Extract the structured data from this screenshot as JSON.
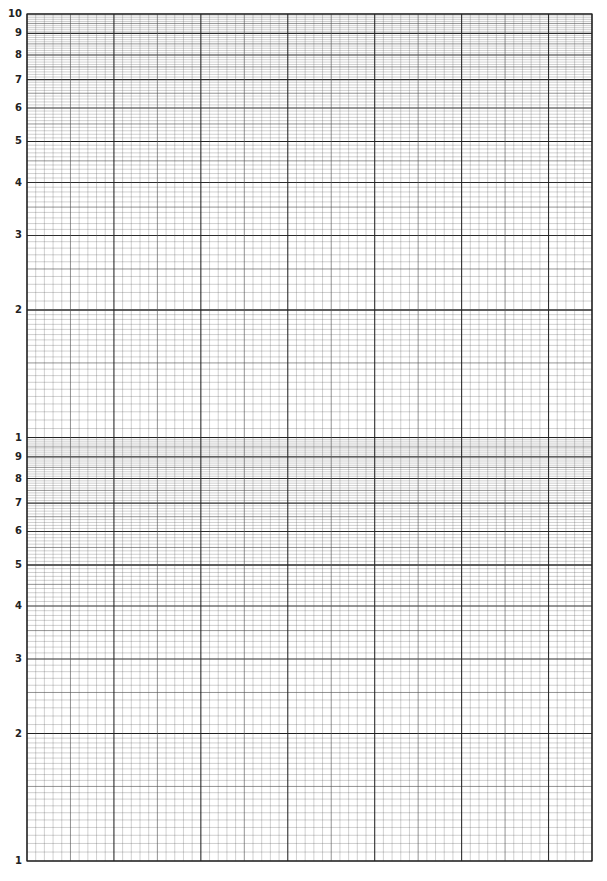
{
  "page": {
    "type": "semi-log graph paper"
  },
  "grid": {
    "left": 27,
    "right": 592,
    "top": 14,
    "bottom": 861,
    "cycles": 2,
    "vertical_divisions": 65,
    "vertical_major_every": 10,
    "vertical_medium_every": 5,
    "line_color": "#555555",
    "major_color": "#222222",
    "background": "#ffffff"
  },
  "y_axis": {
    "scale": "log",
    "decade_labels_top": [
      "10",
      "9",
      "8",
      "7",
      "6",
      "5",
      "4",
      "3",
      "2"
    ],
    "decade_labels_bottom": [
      "1",
      "9",
      "8",
      "7",
      "6",
      "5",
      "4",
      "3",
      "2",
      "1"
    ],
    "labels": [
      {
        "text": "10",
        "value": 10,
        "cycle": 1
      },
      {
        "text": "9",
        "value": 9,
        "cycle": 1
      },
      {
        "text": "8",
        "value": 8,
        "cycle": 1
      },
      {
        "text": "7",
        "value": 7,
        "cycle": 1
      },
      {
        "text": "6",
        "value": 6,
        "cycle": 1
      },
      {
        "text": "5",
        "value": 5,
        "cycle": 1
      },
      {
        "text": "4",
        "value": 4,
        "cycle": 1
      },
      {
        "text": "3",
        "value": 3,
        "cycle": 1
      },
      {
        "text": "2",
        "value": 2,
        "cycle": 1
      },
      {
        "text": "1",
        "value": 1,
        "cycle": 1
      },
      {
        "text": "9",
        "value": 9,
        "cycle": 0
      },
      {
        "text": "8",
        "value": 8,
        "cycle": 0
      },
      {
        "text": "7",
        "value": 7,
        "cycle": 0
      },
      {
        "text": "6",
        "value": 6,
        "cycle": 0
      },
      {
        "text": "5",
        "value": 5,
        "cycle": 0
      },
      {
        "text": "4",
        "value": 4,
        "cycle": 0
      },
      {
        "text": "3",
        "value": 3,
        "cycle": 0
      },
      {
        "text": "2",
        "value": 2,
        "cycle": 0
      },
      {
        "text": "1",
        "value": 1,
        "cycle": 0
      }
    ],
    "subdivisions": [
      {
        "from": 1,
        "to": 2,
        "step": 0.05
      },
      {
        "from": 2,
        "to": 5,
        "step": 0.1
      },
      {
        "from": 5,
        "to": 10,
        "step": 0.1
      }
    ]
  }
}
